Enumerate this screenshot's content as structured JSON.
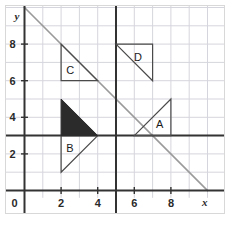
{
  "figure": {
    "kind": "coordinate-grid-diagram",
    "background_color": "#ffffff",
    "border_color": "#d8d8d8",
    "width": 230,
    "height": 229
  },
  "chart_data": {
    "type": "scatter",
    "title": "",
    "xlabel": "x",
    "ylabel": "y",
    "xlim": [
      0,
      10
    ],
    "ylim": [
      0,
      10
    ],
    "grid": true,
    "grid_step": 1,
    "grid_color": "#d5d5dd",
    "legend": "none",
    "xticks": [
      0,
      2,
      4,
      6,
      8
    ],
    "yticks": [
      2,
      4,
      6,
      8
    ],
    "xtick_labels": [
      "0",
      "2",
      "4",
      "6",
      "8"
    ],
    "ytick_labels": [
      "2",
      "4",
      "6",
      "8"
    ],
    "origin_label": "0",
    "axis_color": "#333333",
    "reference_lines": [
      {
        "name": "y-axis",
        "orientation": "vertical",
        "value": 0,
        "color": "#333333",
        "width": 2
      },
      {
        "name": "x-axis",
        "orientation": "horizontal",
        "value": 0,
        "color": "#333333",
        "width": 2
      },
      {
        "name": "mirror-line-vertical",
        "orientation": "vertical",
        "value": 5,
        "color": "#333333",
        "width": 2
      },
      {
        "name": "mirror-line-horizontal",
        "orientation": "horizontal",
        "value": 3,
        "color": "#333333",
        "width": 2
      },
      {
        "name": "mirror-line-diagonal",
        "orientation": "diagonal",
        "from": [
          0,
          10
        ],
        "to": [
          10,
          0
        ],
        "color": "#9a9a9a",
        "width": 1.6
      }
    ],
    "shapes": [
      {
        "label": "A",
        "type": "right-triangle",
        "vertices": [
          [
            6,
            3
          ],
          [
            8,
            5
          ],
          [
            8,
            3
          ]
        ],
        "filled": false,
        "stroke": "#4a4a4a",
        "fill": "none",
        "label_pos": [
          7.35,
          3.6
        ]
      },
      {
        "label": "B",
        "type": "right-triangle",
        "vertices": [
          [
            2,
            3
          ],
          [
            2,
            1
          ],
          [
            4,
            3
          ]
        ],
        "filled": false,
        "stroke": "#4a4a4a",
        "fill": "none",
        "label_pos": [
          2.45,
          2.25
        ]
      },
      {
        "label": "C",
        "type": "right-triangle",
        "vertices": [
          [
            2,
            8
          ],
          [
            2,
            6
          ],
          [
            4,
            6
          ]
        ],
        "filled": false,
        "stroke": "#4a4a4a",
        "fill": "none",
        "label_pos": [
          2.45,
          6.55
        ]
      },
      {
        "label": "D",
        "type": "right-triangle",
        "vertices": [
          [
            5,
            8
          ],
          [
            7,
            8
          ],
          [
            7,
            6
          ]
        ],
        "filled": false,
        "stroke": "#4a4a4a",
        "fill": "none",
        "label_pos": [
          6.15,
          7.25
        ]
      },
      {
        "label": "",
        "name": "shaded-triangle",
        "type": "right-triangle",
        "vertices": [
          [
            2,
            5
          ],
          [
            2,
            3
          ],
          [
            4,
            3
          ]
        ],
        "filled": true,
        "stroke": "#2b2b2b",
        "fill": "#2b2b2b",
        "label_pos": null
      }
    ]
  }
}
